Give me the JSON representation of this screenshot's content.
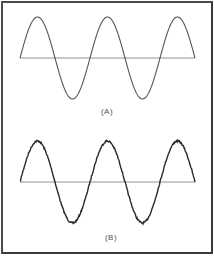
{
  "figure": {
    "panels": [
      {
        "id": "A",
        "label": "(A)",
        "description": "clean sine wave, 2.5 cycles, with horizontal zero axis",
        "baseline_y": 58,
        "amplitude": 41,
        "x_start": 20,
        "x_end": 195,
        "period": 70,
        "noise": 0,
        "stroke_color": "#555555",
        "stroke_width": 1.1
      },
      {
        "id": "B",
        "label": "(B)",
        "description": "noisy sine wave, 2.5 cycles, with horizontal zero axis",
        "baseline_y": 182,
        "amplitude": 41,
        "x_start": 20,
        "x_end": 195,
        "period": 70,
        "noise": 0.9,
        "stroke_color": "#2a2a2a",
        "stroke_width": 1.4
      }
    ],
    "axis_color": "#777777",
    "frame_color": "#4a4a4a"
  }
}
